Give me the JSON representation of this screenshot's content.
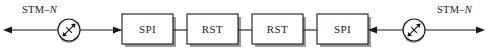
{
  "diagram": {
    "colors": {
      "line": "#1a1a1a",
      "box_fill": "#ffffff",
      "box_stroke": "#1a1a1a",
      "shadow": "#9a9a9a",
      "background": "#ffffff"
    },
    "ports": [
      {
        "id": "left-port",
        "label_prefix": "STM–",
        "label_suffix": "N",
        "label_full": "STM–N",
        "direction": "out-left"
      },
      {
        "id": "right-port",
        "label_prefix": "STM–",
        "label_suffix": "N",
        "label_full": "STM–N",
        "direction": "out-right"
      }
    ],
    "attenuators": [
      {
        "id": "left-attenuator",
        "symbol": "variable-attenuator",
        "cx": 69,
        "cy": 30,
        "r": 11
      },
      {
        "id": "right-attenuator",
        "symbol": "variable-attenuator",
        "cx": 414,
        "cy": 30,
        "r": 11
      }
    ],
    "blocks": [
      {
        "id": "block-1",
        "label": "SPI",
        "x": 122,
        "y": 14,
        "w": 51,
        "h": 30
      },
      {
        "id": "block-2",
        "label": "RST",
        "x": 187,
        "y": 14,
        "w": 51,
        "h": 30
      },
      {
        "id": "block-3",
        "label": "RST",
        "x": 252,
        "y": 14,
        "w": 51,
        "h": 30
      },
      {
        "id": "block-4",
        "label": "SPI",
        "x": 317,
        "y": 14,
        "w": 51,
        "h": 30
      }
    ],
    "links": [
      {
        "id": "link-1-2",
        "from": "block-1",
        "to": "block-2"
      },
      {
        "id": "link-2-3",
        "from": "block-2",
        "to": "block-3"
      },
      {
        "id": "link-3-4",
        "from": "block-3",
        "to": "block-4"
      }
    ],
    "arrows": [
      {
        "id": "arrow-left-outbound",
        "points": "left",
        "x": 4,
        "y": 30
      },
      {
        "id": "arrow-into-left-spi",
        "points": "right",
        "x": 121,
        "y": 30
      },
      {
        "id": "arrow-into-right-spi",
        "points": "left",
        "x": 369,
        "y": 30
      },
      {
        "id": "arrow-right-outbound",
        "points": "right",
        "x": 484,
        "y": 30
      }
    ]
  }
}
